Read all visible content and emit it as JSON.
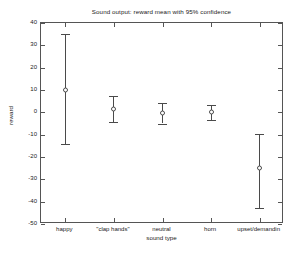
{
  "chart_data": {
    "type": "scatter",
    "title": "Sound output: reward mean with 95% confidence",
    "xlabel": "sound type",
    "ylabel": "reward",
    "ylim": [
      -50,
      40
    ],
    "yticks": [
      40,
      30,
      20,
      10,
      0,
      -10,
      -20,
      -30,
      -40,
      -50
    ],
    "ytick_labels": [
      "40",
      "30",
      "20",
      "10",
      "0",
      "-10",
      "-20",
      "-30",
      "-40",
      "-50"
    ],
    "grid": false,
    "legend": null,
    "categories": [
      "happy",
      "\"clap hands\"",
      "neutral",
      "horn",
      "upset/demandin"
    ],
    "series": [
      {
        "name": "reward mean with 95% confidence",
        "values": [
          10,
          1.5,
          -0.5,
          0.3,
          -25
        ],
        "ci_lower": [
          -14,
          -4.5,
          -5,
          -3.5,
          -43
        ],
        "ci_upper": [
          35,
          7.5,
          4,
          3.5,
          -9.5
        ]
      }
    ],
    "points": [
      {
        "category": "happy",
        "mean": 10,
        "lower": -14,
        "upper": 35
      },
      {
        "category": "\"clap hands\"",
        "mean": 1.5,
        "lower": -4.5,
        "upper": 7.5
      },
      {
        "category": "neutral",
        "mean": -0.5,
        "lower": -5,
        "upper": 4
      },
      {
        "category": "horn",
        "mean": 0.3,
        "lower": -3.5,
        "upper": 3.5
      },
      {
        "category": "upset/demandin",
        "mean": -25,
        "lower": -43,
        "upper": -9.5
      }
    ],
    "colors": {
      "marker": "#4a4a4a",
      "axis": "#555555",
      "text": "#1a1a1a",
      "background": "#ffffff"
    }
  }
}
